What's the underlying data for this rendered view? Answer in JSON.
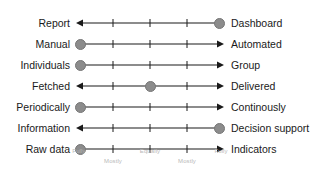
{
  "diagram": {
    "axis": {
      "left_arrow": "arrow-left",
      "right_arrow": "arrow-right",
      "tick_count": 3,
      "line_color": "#1a1a1a",
      "marker_color": "#8c8c8c"
    },
    "rows": [
      {
        "left_label": "Report",
        "right_label": "Dashboard",
        "marker_position": 97
      },
      {
        "left_label": "Manual",
        "right_label": "Automated",
        "marker_position": 3
      },
      {
        "left_label": "Individuals",
        "right_label": "Group",
        "marker_position": 3
      },
      {
        "left_label": "Fetched",
        "right_label": "Delivered",
        "marker_position": 50
      },
      {
        "left_label": "Periodically",
        "right_label": "Continously",
        "marker_position": 3
      },
      {
        "left_label": "Information",
        "right_label": "Decision support",
        "marker_position": 97
      },
      {
        "left_label": "Raw data",
        "right_label": "Indicators",
        "marker_position": 3
      }
    ],
    "scale_labels": [
      {
        "text": "Fully",
        "position": 2,
        "tier": "upper"
      },
      {
        "text": "Mostly",
        "position": 25,
        "tier": "lower"
      },
      {
        "text": "Equally",
        "position": 50,
        "tier": "upper"
      },
      {
        "text": "Mostly",
        "position": 75,
        "tier": "lower"
      },
      {
        "text": "Fully",
        "position": 98,
        "tier": "upper"
      }
    ]
  }
}
